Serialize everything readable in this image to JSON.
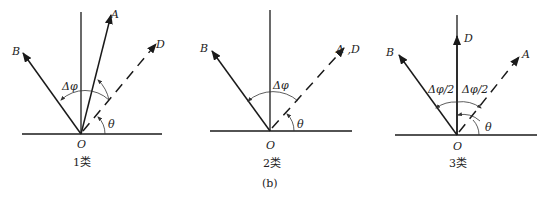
{
  "figure_label": "(b)",
  "panels": [
    {
      "caption": "1类",
      "labels": {
        "A": "A",
        "B": "B",
        "D": "D",
        "O": "O",
        "theta": "θ",
        "dphi": "Δφ"
      }
    },
    {
      "caption": "2类",
      "labels": {
        "AD": "A ,D",
        "B": "B",
        "O": "O",
        "theta": "θ",
        "dphi": "Δφ"
      }
    },
    {
      "caption": "3类",
      "labels": {
        "A": "A",
        "B": "B",
        "D": "D",
        "O": "O",
        "theta": "θ",
        "dphi_left": "Δφ/2",
        "dphi_right": "Δφ/2"
      }
    }
  ],
  "colors": {
    "line": "#1a1a1a",
    "arc": "#333333"
  }
}
